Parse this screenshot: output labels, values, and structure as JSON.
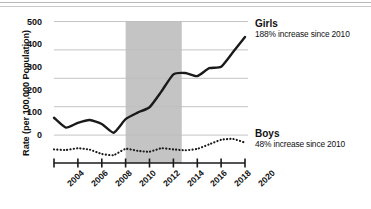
{
  "chart_data": {
    "type": "line",
    "title": "",
    "xlabel": "",
    "ylabel": "Rate (per 100,000 Population)",
    "xlim": [
      2004,
      2020
    ],
    "ylim": [
      0,
      500
    ],
    "grid": true,
    "legend_position": "right-inline-annotations",
    "x_ticks": [
      "2004",
      "2006",
      "2008",
      "2010",
      "2012",
      "2014",
      "2016",
      "2018",
      "2020"
    ],
    "y_ticks": [
      "0",
      "100",
      "200",
      "300",
      "400",
      "500"
    ],
    "x": [
      2004,
      2005,
      2006,
      2007,
      2008,
      2009,
      2010,
      2011,
      2012,
      2013,
      2014,
      2015,
      2016,
      2017,
      2018,
      2019,
      2020
    ],
    "series": [
      {
        "name": "Girls",
        "style": "solid",
        "color": "#1a1a1a",
        "values": [
          160,
          125,
          142,
          152,
          138,
          107,
          155,
          178,
          197,
          253,
          313,
          318,
          307,
          335,
          340,
          392,
          445
        ]
      },
      {
        "name": "Boys",
        "style": "dotted",
        "color": "#1a1a1a",
        "values": [
          48,
          46,
          52,
          47,
          32,
          28,
          50,
          43,
          40,
          52,
          48,
          45,
          50,
          66,
          82,
          85,
          72
        ]
      }
    ],
    "shaded_band": {
      "label": "",
      "x_start": 2010,
      "x_end": 2014.7,
      "color": "#c4c4c4"
    },
    "annotations": [
      {
        "id": "girls",
        "title": "Girls",
        "subtitle": "188% increase since 2010"
      },
      {
        "id": "boys",
        "title": "Boys",
        "subtitle": "48% increase since 2010"
      }
    ]
  },
  "colors": {
    "axis": "#1a1a1a",
    "gridline": "#bdbdbd",
    "band": "#c4c4c4",
    "line": "#1a1a1a",
    "rule": "#b9b9b9",
    "background": "#ffffff"
  }
}
